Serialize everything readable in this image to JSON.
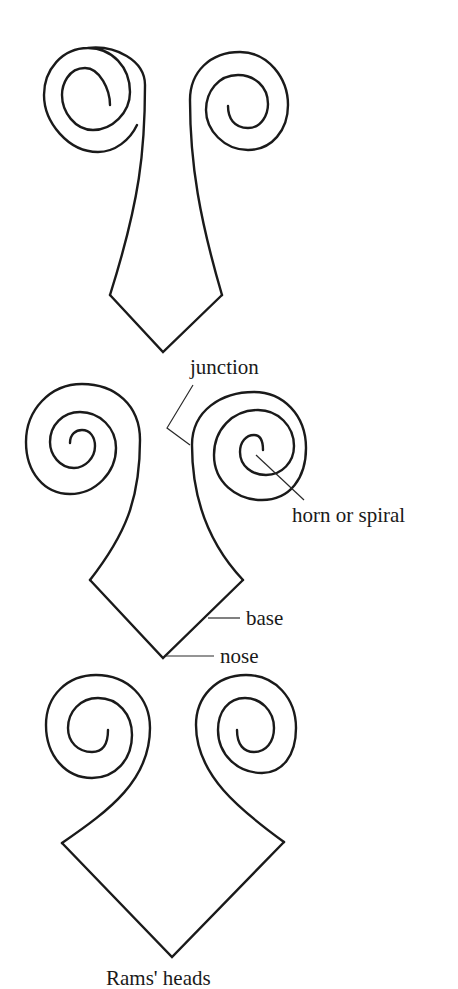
{
  "figure": {
    "caption": "Rams' heads",
    "variants": [
      {
        "id": "ram-head-1",
        "description": "narrow tapering stem with small pointed base"
      },
      {
        "id": "ram-head-2",
        "description": "labelled example"
      },
      {
        "id": "ram-head-3",
        "description": "wide diamond base with curled horns"
      }
    ],
    "labels": {
      "junction": "junction",
      "horn": "horn or spiral",
      "base": "base",
      "nose": "nose"
    },
    "colors": {
      "line": "#1a1a1a",
      "background": "#ffffff"
    }
  }
}
